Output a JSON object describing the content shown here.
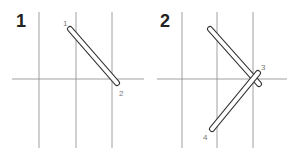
{
  "panels": [
    {
      "step": "1",
      "grid": {
        "verticals": [
          39,
          76,
          112
        ],
        "horizontal": 79,
        "x1": 12,
        "x2": 144,
        "y1": 12,
        "y2": 148
      },
      "strokes": [
        {
          "from": [
            70,
            29
          ],
          "to": [
            117,
            83
          ],
          "start_label": "1",
          "end_label": "2"
        }
      ]
    },
    {
      "step": "2",
      "grid": {
        "verticals": [
          182,
          217,
          253
        ],
        "horizontal": 79,
        "x1": 157,
        "x2": 287,
        "y1": 12,
        "y2": 148
      },
      "strokes": [
        {
          "from": [
            210,
            29
          ],
          "to": [
            259,
            84
          ],
          "start_label": "",
          "end_label": ""
        },
        {
          "from": [
            258,
            73
          ],
          "to": [
            212,
            129
          ],
          "start_label": "3",
          "end_label": "4"
        }
      ]
    }
  ],
  "colors": {
    "grid": "#555555",
    "stroke_outline": "#333333",
    "stroke_fill": "#ffffff",
    "label": "#777777",
    "step": "#222222"
  }
}
